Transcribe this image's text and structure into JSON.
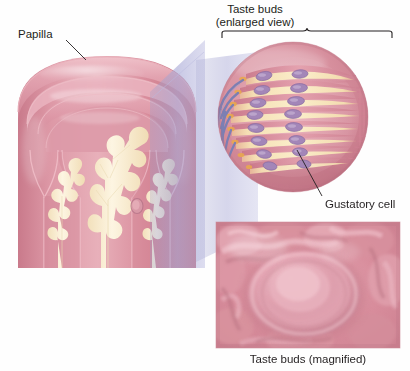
{
  "figure": {
    "background_color": "#ffffff"
  },
  "labels": {
    "papilla": "Papilla",
    "taste_buds_enlarged_line1": "Taste buds",
    "taste_buds_enlarged_line2": "(enlarged view)",
    "gustatory_cell": "Gustatory cell",
    "taste_buds_magnified": "Taste buds (magnified)",
    "watermark": ""
  },
  "panels": {
    "cross_section": {
      "name": "papilla-cross-section",
      "description": "Cutaway of a circumvallate papilla showing epithelium and connective tissue cores",
      "bounds": {
        "x": 0,
        "y": 40,
        "width": 205,
        "height": 228
      }
    },
    "enlarged_circle": {
      "name": "taste-buds-enlarged-view",
      "description": "Circular magnified view of taste buds with gustatory cells and nerve fibers",
      "center_x": 293,
      "center_y": 117,
      "radius": 75,
      "taste_bud_count": 8
    },
    "magnified_photo": {
      "name": "taste-buds-photo",
      "description": "Photographic inset of taste buds on the tongue surface",
      "bounds": {
        "x": 216,
        "y": 222,
        "width": 184,
        "height": 126
      }
    }
  },
  "bracket": {
    "name": "enlarged-view-bracket",
    "left_x": 222,
    "right_x": 392,
    "y": 31,
    "caret_x": 307
  },
  "leaders": {
    "papilla": {
      "x1": 66,
      "y1": 40,
      "x2": 84,
      "y2": 58
    },
    "gustatory_cell": {
      "x1": 322,
      "y1": 196,
      "x2": 298,
      "y2": 152
    }
  },
  "colors": {
    "epithelium_pink": "#d98b99",
    "epithelium_pink_light": "#e6a9b4",
    "epithelium_pink_deep": "#c4707f",
    "outline_pink": "#e8aeb8",
    "connective_cream": "#f7e9c8",
    "connective_cream_light": "#fcf4df",
    "taste_bud_band": "#f6e3bd",
    "gustatory_cell_purple": "#9b7fb0",
    "gustatory_cell_purple_light": "#b9a0c9",
    "nerve_fiber_blue": "#7b7fb5",
    "wedge_lavender": "#a9a9d4",
    "photo_pink": "#d7808f",
    "photo_pink_light": "#eec3cc",
    "text_color": "#231f20",
    "bracket_color": "#231f20"
  }
}
